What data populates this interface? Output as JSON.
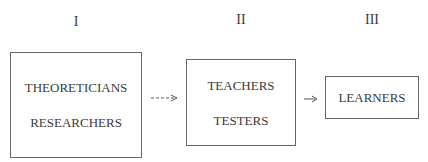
{
  "stages": [
    {
      "numeral": "I",
      "lines": [
        "THEORETICIANS",
        "RESEARCHERS"
      ]
    },
    {
      "numeral": "II",
      "lines": [
        "TEACHERS",
        "TESTERS"
      ]
    },
    {
      "numeral": "III",
      "lines": [
        "LEARNERS"
      ]
    }
  ],
  "arrows": [
    {
      "from": "I",
      "to": "II",
      "style": "dashed",
      "glyph": "- - -→"
    },
    {
      "from": "II",
      "to": "III",
      "style": "solid",
      "glyph": "→"
    }
  ]
}
